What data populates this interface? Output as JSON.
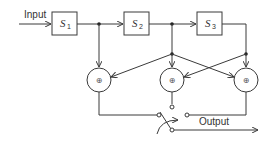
{
  "diagram": {
    "type": "block-diagram",
    "input_label": "Input",
    "output_label": "Output",
    "blocks": [
      {
        "id": "S1",
        "symbol": "S",
        "subscript": "1"
      },
      {
        "id": "S2",
        "symbol": "S",
        "subscript": "2"
      },
      {
        "id": "S3",
        "symbol": "S",
        "subscript": "3"
      }
    ],
    "adders": [
      {
        "id": "adder-1",
        "symbol": "⊕"
      },
      {
        "id": "adder-2",
        "symbol": "⊕"
      },
      {
        "id": "adder-3",
        "symbol": "⊕"
      }
    ],
    "switch": {
      "positions": 3,
      "label": "selector switch"
    },
    "colors": {
      "line": "#3a3a3a",
      "background": "#ffffff"
    }
  }
}
